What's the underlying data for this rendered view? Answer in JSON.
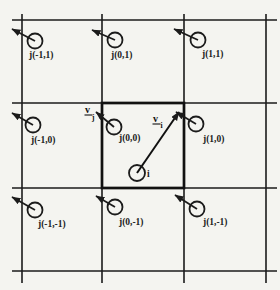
{
  "colors": {
    "background": "#f4f4f0",
    "ink": "#1b1b1b"
  },
  "diagram": {
    "particles": [
      {
        "label": "j(-1,1)"
      },
      {
        "label": "j(0,1)"
      },
      {
        "label": "j(1,1)"
      },
      {
        "label": "j(-1,0)"
      },
      {
        "label": "j(0,0)"
      },
      {
        "label": "j(1,0)"
      },
      {
        "label": "j(-1,-1)"
      },
      {
        "label": "j(0,-1)"
      },
      {
        "label": "j(1,-1)"
      }
    ],
    "center_particle_label": "i",
    "vector_v_symbol": "v",
    "vector_i_subscript": "i",
    "vector_j_subscript": "j"
  }
}
